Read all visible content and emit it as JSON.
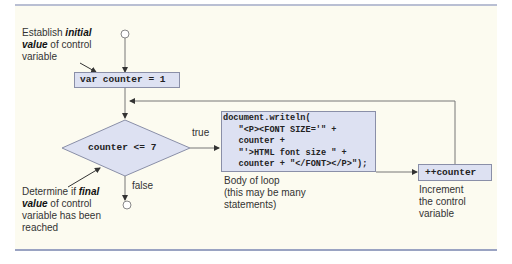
{
  "diagram": {
    "init_annotation": {
      "prefix": "Establish ",
      "emph": "initial",
      "line2_emph": "value",
      "line2_rest": " of control",
      "line3": "variable"
    },
    "init_statement": "var counter = 1",
    "condition": "counter <= 7",
    "true_label": "true",
    "false_label": "false",
    "condition_annotation": {
      "prefix": "Determine if ",
      "emph": "final",
      "line2_emph": "value",
      "line2_rest": " of control",
      "line3": "variable has been",
      "line4": "reached"
    },
    "body_code": [
      "document.writeln(",
      "   \"<P><FONT SIZE='\" +",
      "   counter +",
      "   \"'>HTML font size \" +",
      "   counter + \"</FONT></P>\");"
    ],
    "body_annotation": [
      "Body of loop",
      "(this may be many",
      "statements)"
    ],
    "increment_statement": "++counter",
    "increment_annotation": [
      "Increment",
      "the control",
      "variable"
    ]
  },
  "colors": {
    "panel": "#fcfbf0",
    "box_fill": "#dde1f2",
    "box_stroke": "#8a8fa8",
    "rule": "#9aa3c2",
    "line": "#555555"
  }
}
